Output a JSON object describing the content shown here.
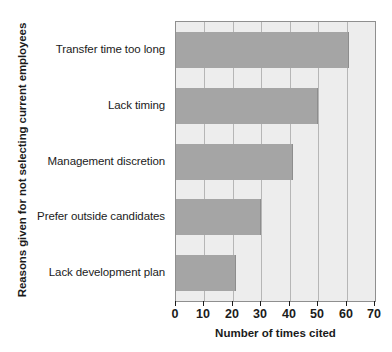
{
  "chart_data": {
    "type": "bar",
    "orientation": "horizontal",
    "title": "",
    "xlabel": "Number of times cited",
    "ylabel": "Reasons given for not selecting current employees",
    "categories": [
      "Transfer time too long",
      "Lack timing",
      "Management discretion",
      "Prefer outside candidates",
      "Lack development plan"
    ],
    "values": [
      61,
      50,
      41,
      30,
      21
    ],
    "xlim": [
      0,
      70
    ],
    "xticks": [
      0,
      10,
      20,
      30,
      40,
      50,
      60,
      70
    ],
    "xtick_labels": [
      "0",
      "10",
      "20",
      "30",
      "40",
      "50",
      "60",
      "70"
    ],
    "grid": "vertical",
    "legend": null,
    "colors": {
      "bar_fill": "#a5a5a5",
      "bar_edge": "#8d8d8d",
      "plot_background": "#ededed",
      "plot_border": "#8f8f8f",
      "gridline": "#b6b6b6",
      "text": "#1b1b1b",
      "figure_background": "#ffffff"
    }
  }
}
